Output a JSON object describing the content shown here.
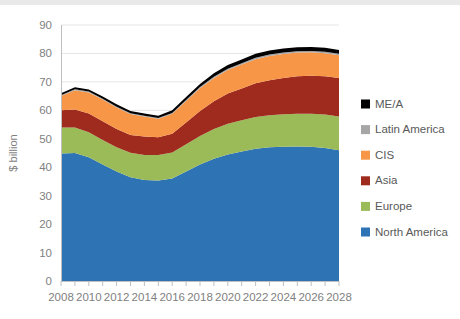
{
  "chart_data": {
    "type": "area",
    "stacked": true,
    "title": "",
    "xlabel": "",
    "ylabel": "$ billion",
    "ylim": [
      0,
      90
    ],
    "ytick_step": 10,
    "yticks": [
      0,
      10,
      20,
      30,
      40,
      50,
      60,
      70,
      80,
      90
    ],
    "xlim": [
      2008,
      2028
    ],
    "x": [
      2008,
      2009,
      2010,
      2011,
      2012,
      2013,
      2014,
      2015,
      2016,
      2017,
      2018,
      2019,
      2020,
      2021,
      2022,
      2023,
      2024,
      2025,
      2026,
      2027,
      2028
    ],
    "xticks": [
      2008,
      2010,
      2012,
      2014,
      2016,
      2018,
      2020,
      2022,
      2024,
      2026,
      2028
    ],
    "xtick_labels": [
      "2008",
      "2010",
      "2012",
      "2014",
      "2016",
      "2018",
      "2020",
      "2022",
      "2024",
      "2026",
      "2028"
    ],
    "grid": true,
    "grid_axis": "y",
    "legend_position": "right",
    "series": [
      {
        "name": "North America",
        "color": "#2E74B5",
        "values": [
          44.8,
          45.0,
          43.5,
          41.0,
          38.5,
          36.5,
          35.5,
          35.3,
          36.0,
          38.5,
          41.0,
          43.0,
          44.5,
          45.5,
          46.5,
          47.0,
          47.2,
          47.3,
          47.2,
          46.8,
          46.0
        ]
      },
      {
        "name": "Europe",
        "color": "#9BBB59",
        "values": [
          9.2,
          9.0,
          8.8,
          8.6,
          8.5,
          8.6,
          8.8,
          9.0,
          9.2,
          9.6,
          10.0,
          10.4,
          10.8,
          11.0,
          11.2,
          11.3,
          11.4,
          11.5,
          11.6,
          11.7,
          11.8
        ]
      },
      {
        "name": "Asia",
        "color": "#9E2B1E",
        "values": [
          6.0,
          6.3,
          6.6,
          6.6,
          6.4,
          6.2,
          6.5,
          6.2,
          6.6,
          7.6,
          8.8,
          9.8,
          10.6,
          11.2,
          11.8,
          12.3,
          12.8,
          13.2,
          13.4,
          13.5,
          13.6
        ]
      },
      {
        "name": "CIS",
        "color": "#F79646",
        "values": [
          5.0,
          6.8,
          7.4,
          7.6,
          7.6,
          7.4,
          7.0,
          6.5,
          7.0,
          7.6,
          8.0,
          8.2,
          8.3,
          8.4,
          8.5,
          8.5,
          8.4,
          8.3,
          8.2,
          8.1,
          8.0
        ]
      },
      {
        "name": "Latin America",
        "color": "#A6A6A6",
        "values": [
          0.3,
          0.3,
          0.3,
          0.3,
          0.3,
          0.3,
          0.3,
          0.3,
          0.3,
          0.35,
          0.4,
          0.4,
          0.45,
          0.45,
          0.5,
          0.5,
          0.5,
          0.5,
          0.5,
          0.5,
          0.5
        ]
      },
      {
        "name": "ME/A",
        "color": "#000000",
        "values": [
          0.7,
          0.7,
          0.7,
          0.8,
          0.8,
          0.8,
          0.8,
          0.8,
          0.9,
          1.0,
          1.1,
          1.2,
          1.3,
          1.3,
          1.4,
          1.4,
          1.4,
          1.4,
          1.4,
          1.4,
          1.3
        ]
      }
    ],
    "totals": [
      66.0,
      68.1,
      67.3,
      64.9,
      62.1,
      59.8,
      58.9,
      58.1,
      60.0,
      64.6,
      69.3,
      73.0,
      75.95,
      77.85,
      79.9,
      81.0,
      81.7,
      82.2,
      82.3,
      82.0,
      81.2
    ],
    "legend_entries": [
      {
        "label": "ME/A",
        "color": "#000000"
      },
      {
        "label": "Latin America",
        "color": "#A6A6A6"
      },
      {
        "label": "CIS",
        "color": "#F79646"
      },
      {
        "label": "Asia",
        "color": "#9E2B1E"
      },
      {
        "label": "Europe",
        "color": "#9BBB59"
      },
      {
        "label": "North America",
        "color": "#2E74B5"
      }
    ]
  }
}
